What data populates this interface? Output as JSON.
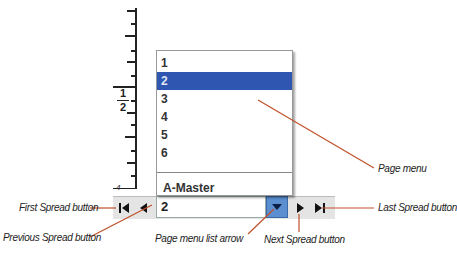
{
  "ruler": {
    "label_top": "1",
    "label_bottom": "2",
    "bottom_mark": "4"
  },
  "page_menu": {
    "items": [
      {
        "label": "1",
        "selected": false
      },
      {
        "label": "2",
        "selected": true
      },
      {
        "label": "3",
        "selected": false
      },
      {
        "label": "4",
        "selected": false
      },
      {
        "label": "5",
        "selected": false
      },
      {
        "label": "6",
        "selected": false
      }
    ],
    "master_item": "A-Master",
    "current_value": "2"
  },
  "nav": {
    "first_icon": "first-spread-icon",
    "prev_icon": "previous-spread-icon",
    "next_icon": "next-spread-icon",
    "last_icon": "last-spread-icon",
    "dropdown_icon": "chevron-down-icon"
  },
  "callouts": {
    "page_menu": "Page menu",
    "first_spread": "First Spread button",
    "previous_spread": "Previous Spread button",
    "page_menu_arrow": "Page menu list arrow",
    "next_spread": "Next Spread button",
    "last_spread": "Last Spread button"
  },
  "colors": {
    "callout_line": "#c0502a",
    "selection": "#2f56b0",
    "dropdown_button": "#5b8fd0"
  }
}
